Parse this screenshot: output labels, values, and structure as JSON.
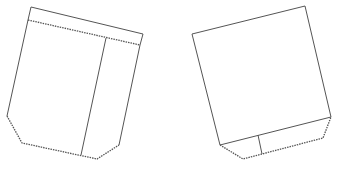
{
  "diagram": {
    "title": "",
    "stroke_color": "#555555",
    "background": "#ffffff",
    "shapes": [
      {
        "name": "left-pocket-pattern",
        "outline": "31,7 143,34 140,45 119,145 97,159 80,156 22,143 7,116 28,20",
        "top_band": "28,20 140,45",
        "divider": "106,38 81,155",
        "zigzag_edges": [
          "28,20 140,45",
          "7,116 22,143 80,156",
          "97,159 119,145"
        ]
      },
      {
        "name": "right-pocket-pattern",
        "outline": "192,34 305,6 331,117 323,138 262,154 243,159 220,145",
        "bottom_band": "220,145 331,117",
        "divider": "258,135 262,154",
        "zigzag_edges": [
          "220,145 243,159 262,154",
          "262,154 323,138 331,117"
        ]
      }
    ]
  }
}
